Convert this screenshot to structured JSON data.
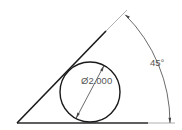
{
  "drawing": {
    "angle_label": "45°",
    "diameter_label": "Ø2.000",
    "colors": {
      "geometry": "#1a1a1a",
      "extension": "#aaaaaa",
      "dimension": "#444444",
      "text": "#555555"
    }
  }
}
